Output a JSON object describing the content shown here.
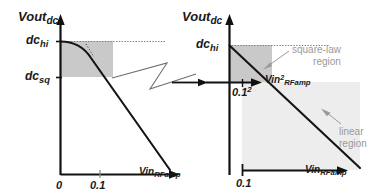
{
  "figure": {
    "title_visible": false,
    "colors": {
      "ink": "#1a1a1a",
      "axis": "#111111",
      "square_law_fill": "#c9c9c9",
      "linear_fill": "#ededed",
      "annotation_gray": "#9a9a9a",
      "dotted_gray": "#8a8a8a",
      "background": "#ffffff"
    }
  },
  "left_panel": {
    "name": "overview-plot",
    "y_axis": {
      "label_main": "Vout",
      "label_sub": "dc",
      "ticks": [
        {
          "label_main": "dc",
          "label_sub": "hi",
          "value": "dc_hi"
        },
        {
          "label_main": "dc",
          "label_sub": "sq",
          "value": "dc_sq"
        }
      ]
    },
    "x_axis": {
      "label_main": "Vin",
      "label_sub": "RFamp",
      "ticks": [
        {
          "label": "0",
          "value": 0
        },
        {
          "label": "0.1",
          "value": 0.1
        }
      ]
    },
    "shaded_region": {
      "name": "square-law-region-box",
      "x_from": 0,
      "x_to": 0.1,
      "y_from": "dc_sq",
      "y_to": "dc_hi"
    },
    "curve": {
      "name": "vout-dc-curve",
      "description": "flat near dc_hi, knee at 0.1, then linear decreasing"
    },
    "dotted_level_line": {
      "name": "dc-hi-level-line",
      "value": "dc_hi"
    }
  },
  "right_panel": {
    "name": "zoomed-detail-plot",
    "y_axis": {
      "label_main": "Vout",
      "label_sub": "dc",
      "ticks": [
        {
          "label_main": "dc",
          "label_sub": "hi",
          "value": "dc_hi"
        }
      ]
    },
    "x_axis_upper": {
      "label_main": "Vin",
      "label_sup": "2",
      "label_sub": "RFamp",
      "ticks": [
        {
          "label_main": "0.1",
          "label_sup": "2",
          "value": 0.01
        }
      ]
    },
    "x_axis_lower": {
      "label_main": "Vin",
      "label_sub": "RFamp",
      "ticks": [
        {
          "label": "0.1",
          "value": 0.1
        }
      ]
    },
    "annotations": [
      {
        "name": "square-law-region-label",
        "line1": "square-law",
        "line2": "region"
      },
      {
        "name": "linear-region-label",
        "line1": "linear",
        "line2": "region"
      }
    ],
    "regions": [
      {
        "name": "square-law-region-fill",
        "tone": "dark"
      },
      {
        "name": "linear-region-fill",
        "tone": "light"
      }
    ],
    "dotted_level_line": {
      "name": "dc-hi-level-line",
      "value": "dc_hi"
    }
  },
  "connector": {
    "name": "zigzag-zoom-connector",
    "description": "lightning-bolt style callout linking left knee region to right panel"
  }
}
